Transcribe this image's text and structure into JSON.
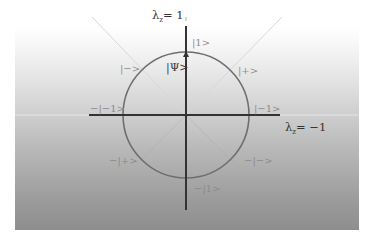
{
  "diagram": {
    "type": "qubit-state-circle",
    "axes": {
      "vertical_label_prefix": "λ",
      "vertical_label_sub": "z",
      "vertical_label_suffix": "= 1",
      "horizontal_label_prefix": "λ",
      "horizontal_label_sub": "z",
      "horizontal_label_suffix": "= −1"
    },
    "state_labels": {
      "top": "|1>",
      "psi": "|Ψ>",
      "upper_left": "|−>",
      "upper_right": "|+>",
      "left": "−|−1>",
      "right": "|−1>",
      "lower_left": "−|+>",
      "lower_right": "−|−>",
      "bottom": "−|1>"
    },
    "colors": {
      "axis": "#333333",
      "circle": "#6e6e6e",
      "diagonal": "#dcdcdc",
      "label": "#8c8c8c",
      "gradient_top": "#ffffff",
      "gradient_bottom": "#8e8e8e"
    }
  }
}
